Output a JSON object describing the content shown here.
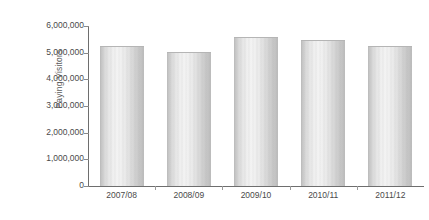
{
  "chart_data": {
    "type": "bar",
    "title": "",
    "xlabel": "",
    "ylabel": "Paying Visitors",
    "categories": [
      "2007/08",
      "2008/09",
      "2009/10",
      "2010/11",
      "2011/12"
    ],
    "values": [
      5200000,
      5000000,
      5550000,
      5450000,
      5200000
    ],
    "series": [
      {
        "name": "Paying Visitors",
        "values": [
          5200000,
          5000000,
          5550000,
          5450000,
          5200000
        ]
      }
    ],
    "ylim": [
      0,
      6000000
    ],
    "ytick_values": [
      0,
      1000000,
      2000000,
      3000000,
      4000000,
      5000000,
      6000000
    ],
    "ytick_labels": [
      "0",
      "1,000,000",
      "2,000,000",
      "3,000,000",
      "4,000,000",
      "5,000,000",
      "6,000,000"
    ],
    "grid": false,
    "legend": false,
    "legend_position": "none",
    "bar_color": "#dcdcdc",
    "axis_color": "#6e6e6e",
    "text_color": "#4a4a4a"
  }
}
